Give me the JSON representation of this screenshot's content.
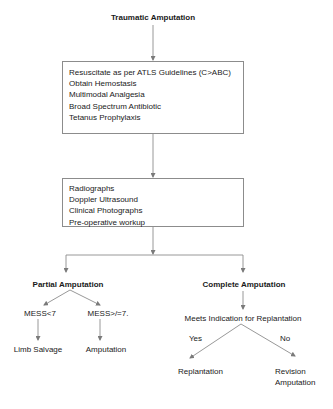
{
  "title": "Traumatic Amputation",
  "initial_management": {
    "items": [
      "Resuscitate as per ATLS Guidelines (C>ABC)",
      "Obtain Hemostasis",
      "Multimodal Analgesia",
      "Broad Spectrum Antibiotic",
      "Tetanus Prophylaxis"
    ]
  },
  "workup": {
    "items": [
      "Radiographs",
      "Doppler Ultrasound",
      "Clinical Photographs",
      "Pre-operative workup"
    ]
  },
  "partial": {
    "label": "Partial Amputation",
    "branches": [
      {
        "condition": "MESS<7",
        "outcome": "Limb Salvage"
      },
      {
        "condition": "MESS>/=7.",
        "outcome": "Amputation"
      }
    ]
  },
  "complete": {
    "label": "Complete Amputation",
    "decision": "Meets Indication for Replantation",
    "branches": [
      {
        "answer": "Yes",
        "outcome": "Replantation"
      },
      {
        "answer": "No",
        "outcome_line1": "Revision",
        "outcome_line2": "Amputation"
      }
    ]
  },
  "colors": {
    "line": "#8c8c8c",
    "text": "#1a1a1a",
    "background": "#ffffff"
  }
}
